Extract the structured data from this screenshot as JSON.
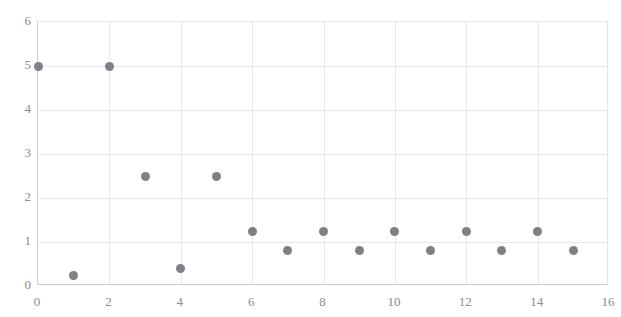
{
  "chart_data": {
    "type": "scatter",
    "title": "",
    "xlabel": "",
    "ylabel": "",
    "xlim": [
      0,
      16
    ],
    "ylim": [
      0,
      6
    ],
    "xticks": [
      0,
      2,
      4,
      6,
      8,
      10,
      12,
      14,
      16
    ],
    "yticks": [
      0,
      1,
      2,
      3,
      4,
      5,
      6
    ],
    "grid": true,
    "legend": false,
    "marker_color": "#7f7f85",
    "gridline_color": "#e8e8ec",
    "tick_label_color": "#8a8a90",
    "x": [
      0,
      1,
      2,
      3,
      4,
      5,
      6,
      7,
      8,
      9,
      10,
      11,
      12,
      13,
      14,
      15
    ],
    "values": [
      5,
      0.25,
      5,
      2.5,
      0.4,
      2.5,
      1.25,
      0.8,
      1.25,
      0.8,
      1.25,
      0.8,
      1.25,
      0.8,
      1.25,
      0.8
    ],
    "points": [
      {
        "x": 0,
        "y": 5
      },
      {
        "x": 1,
        "y": 0.25
      },
      {
        "x": 2,
        "y": 5
      },
      {
        "x": 3,
        "y": 2.5
      },
      {
        "x": 4,
        "y": 0.4
      },
      {
        "x": 5,
        "y": 2.5
      },
      {
        "x": 6,
        "y": 1.25
      },
      {
        "x": 7,
        "y": 0.8
      },
      {
        "x": 8,
        "y": 1.25
      },
      {
        "x": 9,
        "y": 0.8
      },
      {
        "x": 10,
        "y": 1.25
      },
      {
        "x": 11,
        "y": 0.8
      },
      {
        "x": 12,
        "y": 1.25
      },
      {
        "x": 13,
        "y": 0.8
      },
      {
        "x": 14,
        "y": 1.25
      },
      {
        "x": 15,
        "y": 0.8
      }
    ]
  }
}
